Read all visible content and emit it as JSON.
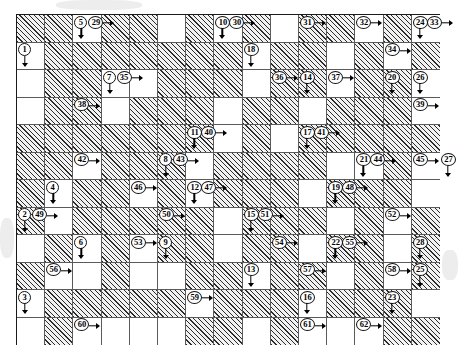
{
  "grid": {
    "columns": 15,
    "rows": 12,
    "cell_width": 28.2,
    "cell_height": 27.5,
    "block_color": "#2b2b2b",
    "empty_color": "#ffffff",
    "border_color": "#1a1a1a",
    "blocked_cells": [
      [
        0,
        0
      ],
      [
        0,
        1
      ],
      [
        0,
        3
      ],
      [
        0,
        4
      ],
      [
        0,
        6
      ],
      [
        0,
        8
      ],
      [
        0,
        10
      ],
      [
        0,
        11
      ],
      [
        0,
        13
      ],
      [
        1,
        1
      ],
      [
        1,
        2
      ],
      [
        1,
        3
      ],
      [
        1,
        4
      ],
      [
        1,
        5
      ],
      [
        1,
        6
      ],
      [
        1,
        7
      ],
      [
        1,
        9
      ],
      [
        1,
        10
      ],
      [
        1,
        12
      ],
      [
        1,
        14
      ],
      [
        2,
        1
      ],
      [
        2,
        2
      ],
      [
        2,
        5
      ],
      [
        2,
        6
      ],
      [
        2,
        7
      ],
      [
        2,
        9
      ],
      [
        2,
        10
      ],
      [
        2,
        12
      ],
      [
        2,
        13
      ],
      [
        3,
        1
      ],
      [
        3,
        2
      ],
      [
        3,
        4
      ],
      [
        3,
        5
      ],
      [
        3,
        6
      ],
      [
        3,
        8
      ],
      [
        3,
        9
      ],
      [
        3,
        11
      ],
      [
        3,
        12
      ],
      [
        3,
        13
      ],
      [
        4,
        0
      ],
      [
        4,
        1
      ],
      [
        4,
        2
      ],
      [
        4,
        3
      ],
      [
        4,
        4
      ],
      [
        4,
        5
      ],
      [
        4,
        6
      ],
      [
        4,
        8
      ],
      [
        4,
        10
      ],
      [
        4,
        11
      ],
      [
        4,
        12
      ],
      [
        4,
        13
      ],
      [
        4,
        14
      ],
      [
        5,
        0
      ],
      [
        5,
        1
      ],
      [
        5,
        3
      ],
      [
        5,
        4
      ],
      [
        5,
        5
      ],
      [
        5,
        7
      ],
      [
        5,
        8
      ],
      [
        5,
        9
      ],
      [
        5,
        10
      ],
      [
        5,
        13
      ],
      [
        6,
        0
      ],
      [
        6,
        2
      ],
      [
        6,
        3
      ],
      [
        6,
        5
      ],
      [
        6,
        7
      ],
      [
        6,
        8
      ],
      [
        6,
        9
      ],
      [
        6,
        11
      ],
      [
        6,
        12
      ],
      [
        6,
        13
      ],
      [
        7,
        0
      ],
      [
        7,
        2
      ],
      [
        7,
        3
      ],
      [
        7,
        4
      ],
      [
        7,
        5
      ],
      [
        7,
        6
      ],
      [
        7,
        8
      ],
      [
        7,
        9
      ],
      [
        7,
        10
      ],
      [
        7,
        12
      ],
      [
        7,
        14
      ],
      [
        8,
        1
      ],
      [
        8,
        3
      ],
      [
        8,
        5
      ],
      [
        8,
        6
      ],
      [
        8,
        8
      ],
      [
        8,
        9
      ],
      [
        8,
        11
      ],
      [
        8,
        12
      ],
      [
        8,
        14
      ],
      [
        9,
        0
      ],
      [
        9,
        3
      ],
      [
        9,
        6
      ],
      [
        9,
        7
      ],
      [
        9,
        9
      ],
      [
        9,
        10
      ],
      [
        9,
        12
      ],
      [
        9,
        14
      ],
      [
        10,
        1
      ],
      [
        10,
        2
      ],
      [
        10,
        3
      ],
      [
        10,
        4
      ],
      [
        10,
        5
      ],
      [
        10,
        7
      ],
      [
        10,
        8
      ],
      [
        10,
        9
      ],
      [
        10,
        11
      ],
      [
        10,
        12
      ],
      [
        10,
        13
      ],
      [
        11,
        1
      ],
      [
        11,
        6
      ],
      [
        11,
        7
      ],
      [
        11,
        9
      ],
      [
        11,
        13
      ],
      [
        11,
        14
      ]
    ],
    "clues": [
      {
        "number": "1",
        "col": 0,
        "row": 1,
        "dir": "down",
        "place": "left"
      },
      {
        "number": "5",
        "col": 2,
        "row": 0,
        "dir": "down",
        "place": "left"
      },
      {
        "number": "29",
        "col": 2,
        "row": 0,
        "dir": "right",
        "place": "right"
      },
      {
        "number": "10",
        "col": 7,
        "row": 0,
        "dir": "down",
        "place": "left"
      },
      {
        "number": "30",
        "col": 7,
        "row": 0,
        "dir": "right",
        "place": "right"
      },
      {
        "number": "31",
        "col": 10,
        "row": 0,
        "dir": "right",
        "place": "left"
      },
      {
        "number": "32",
        "col": 12,
        "row": 0,
        "dir": "right",
        "place": "left"
      },
      {
        "number": "24",
        "col": 14,
        "row": 0,
        "dir": "down",
        "place": "left"
      },
      {
        "number": "33",
        "col": 14,
        "row": 0,
        "dir": "right",
        "place": "right"
      },
      {
        "number": "18",
        "col": 8,
        "row": 1,
        "dir": "down",
        "place": "left"
      },
      {
        "number": "34",
        "col": 13,
        "row": 1,
        "dir": "right",
        "place": "left"
      },
      {
        "number": "7",
        "col": 3,
        "row": 2,
        "dir": "down",
        "place": "left"
      },
      {
        "number": "35",
        "col": 3,
        "row": 2,
        "dir": "right",
        "place": "right"
      },
      {
        "number": "36",
        "col": 9,
        "row": 2,
        "dir": "right",
        "place": "left"
      },
      {
        "number": "14",
        "col": 10,
        "row": 2,
        "dir": "down",
        "place": "left"
      },
      {
        "number": "37",
        "col": 11,
        "row": 2,
        "dir": "right",
        "place": "left"
      },
      {
        "number": "20",
        "col": 13,
        "row": 2,
        "dir": "down",
        "place": "left"
      },
      {
        "number": "26",
        "col": 14,
        "row": 2,
        "dir": "down",
        "place": "left"
      },
      {
        "number": "38",
        "col": 2,
        "row": 3,
        "dir": "right",
        "place": "left"
      },
      {
        "number": "39",
        "col": 14,
        "row": 3,
        "dir": "right",
        "place": "left"
      },
      {
        "number": "11",
        "col": 6,
        "row": 4,
        "dir": "down",
        "place": "left"
      },
      {
        "number": "40",
        "col": 6,
        "row": 4,
        "dir": "right",
        "place": "right"
      },
      {
        "number": "17",
        "col": 10,
        "row": 4,
        "dir": "down",
        "place": "left"
      },
      {
        "number": "41",
        "col": 10,
        "row": 4,
        "dir": "right",
        "place": "right"
      },
      {
        "number": "42",
        "col": 2,
        "row": 5,
        "dir": "right",
        "place": "left"
      },
      {
        "number": "8",
        "col": 5,
        "row": 5,
        "dir": "down",
        "place": "left"
      },
      {
        "number": "43",
        "col": 5,
        "row": 5,
        "dir": "right",
        "place": "right"
      },
      {
        "number": "21",
        "col": 12,
        "row": 5,
        "dir": "down",
        "place": "left"
      },
      {
        "number": "44",
        "col": 12,
        "row": 5,
        "dir": "right",
        "place": "right"
      },
      {
        "number": "45",
        "col": 14,
        "row": 5,
        "dir": "right",
        "place": "left"
      },
      {
        "number": "27",
        "col": 15,
        "row": 5,
        "dir": "down",
        "place": "left"
      },
      {
        "number": "4",
        "col": 1,
        "row": 6,
        "dir": "down",
        "place": "left"
      },
      {
        "number": "46",
        "col": 4,
        "row": 6,
        "dir": "right",
        "place": "left"
      },
      {
        "number": "12",
        "col": 6,
        "row": 6,
        "dir": "down",
        "place": "left"
      },
      {
        "number": "47",
        "col": 6,
        "row": 6,
        "dir": "right",
        "place": "right"
      },
      {
        "number": "19",
        "col": 11,
        "row": 6,
        "dir": "down",
        "place": "left"
      },
      {
        "number": "48",
        "col": 11,
        "row": 6,
        "dir": "right",
        "place": "right"
      },
      {
        "number": "2",
        "col": 0,
        "row": 7,
        "dir": "down",
        "place": "left"
      },
      {
        "number": "49",
        "col": 0,
        "row": 7,
        "dir": "right",
        "place": "right"
      },
      {
        "number": "50",
        "col": 5,
        "row": 7,
        "dir": "right",
        "place": "left"
      },
      {
        "number": "15",
        "col": 8,
        "row": 7,
        "dir": "down",
        "place": "left"
      },
      {
        "number": "51",
        "col": 8,
        "row": 7,
        "dir": "right",
        "place": "right"
      },
      {
        "number": "52",
        "col": 13,
        "row": 7,
        "dir": "right",
        "place": "left"
      },
      {
        "number": "6",
        "col": 2,
        "row": 8,
        "dir": "down",
        "place": "left"
      },
      {
        "number": "53",
        "col": 4,
        "row": 8,
        "dir": "right",
        "place": "left"
      },
      {
        "number": "9",
        "col": 5,
        "row": 8,
        "dir": "down",
        "place": "left"
      },
      {
        "number": "54",
        "col": 9,
        "row": 8,
        "dir": "right",
        "place": "left"
      },
      {
        "number": "22",
        "col": 11,
        "row": 8,
        "dir": "down",
        "place": "left"
      },
      {
        "number": "55",
        "col": 11,
        "row": 8,
        "dir": "right",
        "place": "right"
      },
      {
        "number": "28",
        "col": 14,
        "row": 8,
        "dir": "down",
        "place": "left"
      },
      {
        "number": "56",
        "col": 1,
        "row": 9,
        "dir": "right",
        "place": "left"
      },
      {
        "number": "13",
        "col": 8,
        "row": 9,
        "dir": "down",
        "place": "left"
      },
      {
        "number": "57",
        "col": 10,
        "row": 9,
        "dir": "right",
        "place": "left"
      },
      {
        "number": "58",
        "col": 13,
        "row": 9,
        "dir": "right",
        "place": "left"
      },
      {
        "number": "25",
        "col": 14,
        "row": 9,
        "dir": "down",
        "place": "left"
      },
      {
        "number": "3",
        "col": 0,
        "row": 10,
        "dir": "down",
        "place": "left"
      },
      {
        "number": "59",
        "col": 6,
        "row": 10,
        "dir": "right",
        "place": "left"
      },
      {
        "number": "16",
        "col": 10,
        "row": 10,
        "dir": "down",
        "place": "left"
      },
      {
        "number": "23",
        "col": 13,
        "row": 10,
        "dir": "down",
        "place": "left"
      },
      {
        "number": "60",
        "col": 2,
        "row": 11,
        "dir": "right",
        "place": "left"
      },
      {
        "number": "61",
        "col": 10,
        "row": 11,
        "dir": "right",
        "place": "left"
      },
      {
        "number": "62",
        "col": 12,
        "row": 11,
        "dir": "right",
        "place": "left"
      }
    ]
  }
}
